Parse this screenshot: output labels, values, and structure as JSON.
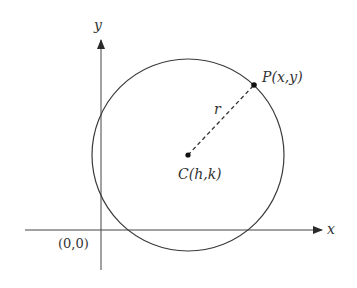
{
  "figure": {
    "type": "circle-on-coordinate-plane",
    "colors": {
      "ink": "#333333",
      "background": "#ffffff"
    },
    "axes": {
      "x_label": "x",
      "y_label": "y",
      "origin_label": "(0,0)"
    },
    "circle": {
      "center_label": "C(h,k)",
      "point_label": "P(x,y)",
      "radius_label": "r"
    }
  }
}
